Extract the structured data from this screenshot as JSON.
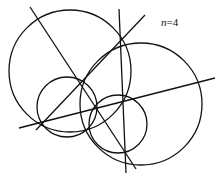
{
  "diagram": {
    "label": {
      "variable": "n",
      "equals": "=",
      "value": "4"
    },
    "stroke_color": "#111111",
    "circles": [
      {
        "name": "large-left-circle",
        "cx": 70,
        "cy": 71,
        "r": 61
      },
      {
        "name": "large-right-circle",
        "cx": 141,
        "cy": 104,
        "r": 61
      },
      {
        "name": "small-left-circle",
        "cx": 67,
        "cy": 107,
        "r": 30
      },
      {
        "name": "small-right-circle",
        "cx": 118,
        "cy": 124,
        "r": 29
      }
    ],
    "lines": [
      {
        "name": "diagonal-line-1",
        "x1": 30,
        "y1": 7,
        "x2": 136,
        "y2": 169
      },
      {
        "name": "near-vertical-line",
        "x1": 119,
        "y1": 9,
        "x2": 126,
        "y2": 173
      },
      {
        "name": "diagonal-line-2",
        "x1": 36,
        "y1": 130,
        "x2": 145,
        "y2": 15
      },
      {
        "name": "shallow-line",
        "x1": 19,
        "y1": 128,
        "x2": 215,
        "y2": 78
      }
    ]
  }
}
